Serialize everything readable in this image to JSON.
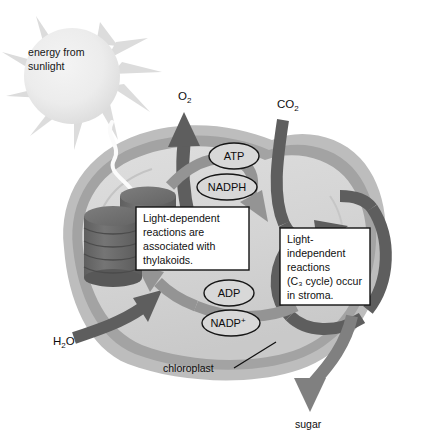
{
  "diagram": {
    "sun": {
      "label_line1": "energy from",
      "label_line2": "sunlight",
      "icon": "sun-icon",
      "fill": "#e8e8e8",
      "ray_fill": "#dcdcdc"
    },
    "chloroplast": {
      "label": "chloroplast",
      "outer_membrane_color": "#bdbdbd",
      "inner_membrane_color": "#9e9e9e",
      "stroma_color": "#d6d6d6"
    },
    "inputs": [
      {
        "name": "water",
        "label_main": "H",
        "label_sub": "2",
        "label_tail": "O",
        "x": 62,
        "y": 342
      },
      {
        "name": "carbon-dioxide",
        "label_main": "CO",
        "label_sub": "2",
        "label_tail": "",
        "x": 284,
        "y": 105
      }
    ],
    "outputs": [
      {
        "name": "oxygen",
        "label_main": "O",
        "label_sub": "2",
        "label_tail": "",
        "x": 182,
        "y": 97
      },
      {
        "name": "sugar",
        "label_main": "sugar",
        "label_sub": "",
        "label_tail": "",
        "x": 316,
        "y": 425
      }
    ],
    "molecules": [
      {
        "name": "atp",
        "label": "ATP",
        "sup": "",
        "cx": 234,
        "cy": 156,
        "rx": 25,
        "ry": 13
      },
      {
        "name": "nadph",
        "label": "NADPH",
        "sup": "",
        "cx": 227,
        "cy": 187,
        "rx": 30,
        "ry": 13
      },
      {
        "name": "adp",
        "label": "ADP",
        "sup": "",
        "cx": 229,
        "cy": 293,
        "rx": 25,
        "ry": 13
      },
      {
        "name": "nadp-plus",
        "label": "NADP",
        "sup": "+",
        "cx": 231,
        "cy": 323,
        "rx": 29,
        "ry": 13
      }
    ],
    "callouts": [
      {
        "name": "light-dependent-callout",
        "lines": [
          "Light-dependent",
          "reactions are",
          "associated with",
          "thylakoids."
        ],
        "x": 136,
        "y": 207,
        "w": 113,
        "h": 63
      },
      {
        "name": "light-independent-callout",
        "lines": [
          "Light-",
          "independent",
          "reactions",
          "(C₃ cycle) occur",
          "in stroma."
        ],
        "x": 280,
        "y": 228,
        "w": 90,
        "h": 77
      }
    ],
    "structures": [
      {
        "name": "thylakoid-granum-left",
        "disks": 6,
        "color": "#707070"
      },
      {
        "name": "thylakoid-granum-right",
        "disks": 4,
        "color": "#6b6b6b"
      }
    ],
    "arrows": {
      "dark_color": "#5e5e5e",
      "mid_color": "#8f8f8f",
      "light_color": "#f2f2f2"
    }
  }
}
